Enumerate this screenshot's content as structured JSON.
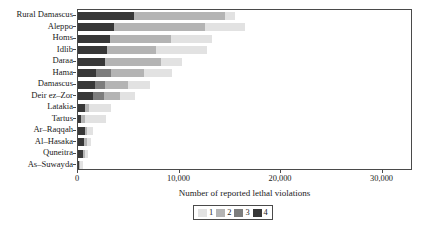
{
  "chart_data": {
    "type": "bar",
    "orientation": "horizontal",
    "stacked": true,
    "title": "",
    "xlabel": "Number of reported lethal violations",
    "ylabel": "",
    "xlim": [
      0,
      33000
    ],
    "xticks": [
      0,
      10000,
      20000,
      30000
    ],
    "xticklabels": [
      "0",
      "10,000",
      "20,000",
      "30,000"
    ],
    "grid": false,
    "legend_position": "bottom",
    "legend_entries": [
      "1",
      "2",
      "3",
      "4"
    ],
    "series_colors": {
      "1": "#e2e2e2",
      "2": "#b4b4b4",
      "3": "#7d7d7d",
      "4": "#383838"
    },
    "categories": [
      "Rural Damascus",
      "Aleppo",
      "Homs",
      "Idlib",
      "Daraa",
      "Hama",
      "Damascus",
      "Deir ez–Zor",
      "Latakia",
      "Tartus",
      "Ar–Raqqah",
      "Al–Hasaka",
      "Quneitra",
      "As–Suwayda"
    ],
    "series": [
      {
        "name": "4",
        "values": [
          5500,
          3500,
          3200,
          2900,
          2700,
          1800,
          1700,
          1500,
          700,
          300,
          650,
          600,
          520,
          120
        ]
      },
      {
        "name": "3",
        "values": [
          0,
          0,
          0,
          0,
          0,
          1500,
          1000,
          1100,
          0,
          0,
          0,
          0,
          0,
          0
        ]
      },
      {
        "name": "2",
        "values": [
          9000,
          9000,
          6000,
          4800,
          5500,
          3200,
          2200,
          1500,
          400,
          350,
          200,
          250,
          150,
          80
        ]
      },
      {
        "name": "1",
        "values": [
          1000,
          4000,
          4000,
          5000,
          2000,
          2800,
          2200,
          1500,
          2200,
          2100,
          600,
          400,
          300,
          250
        ]
      }
    ],
    "totals": [
      15500,
      16500,
      13200,
      12700,
      10200,
      9300,
      7100,
      5600,
      3300,
      2750,
      1450,
      1250,
      970,
      450
    ]
  }
}
